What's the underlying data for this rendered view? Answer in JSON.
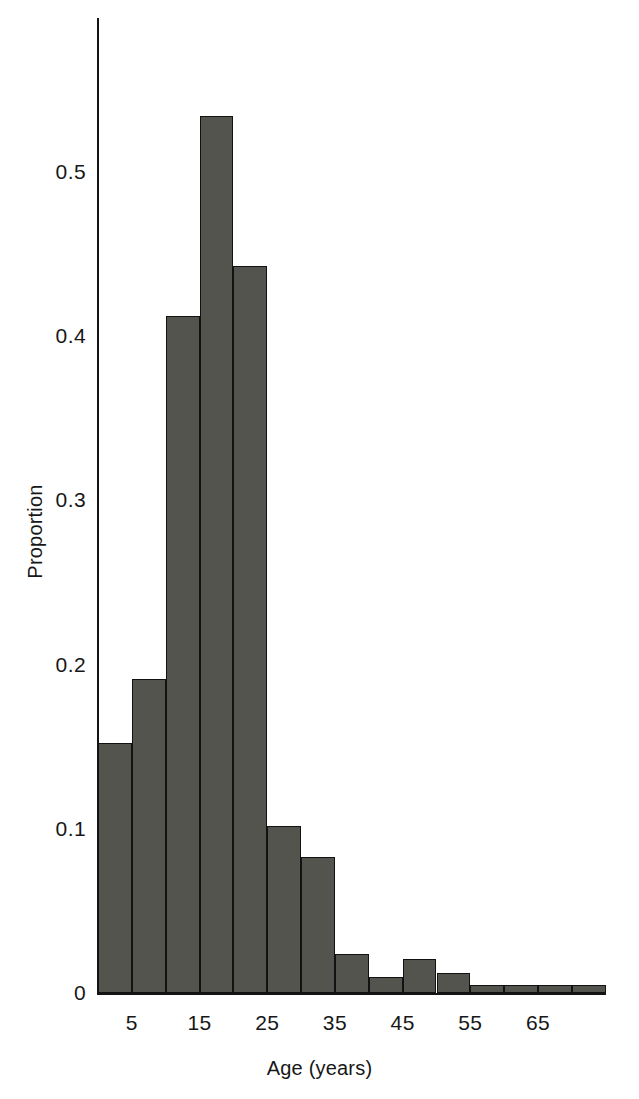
{
  "chart_data": {
    "type": "bar",
    "title": "",
    "subtitle": "",
    "xlabel": "Age (years)",
    "ylabel": "Proportion",
    "grid": false,
    "legend": null,
    "xlim": [
      0,
      75
    ],
    "ylim": [
      0,
      0.55
    ],
    "x_tick_labels": [
      "5",
      "15",
      "25",
      "35",
      "45",
      "55",
      "65"
    ],
    "x_tick_values": [
      5,
      15,
      25,
      35,
      45,
      55,
      65
    ],
    "y_tick_labels": [
      "0",
      "0.1",
      "0.2",
      "0.3",
      "0.4",
      "0.5"
    ],
    "y_tick_values": [
      0,
      0.1,
      0.2,
      0.3,
      0.4,
      0.5
    ],
    "bin_width": 5,
    "bin_edges": [
      0,
      5,
      10,
      15,
      20,
      25,
      30,
      35,
      40,
      45,
      50,
      55,
      60,
      65,
      70,
      75
    ],
    "categories": [
      "0-5",
      "5-10",
      "10-15",
      "15-20",
      "20-25",
      "25-30",
      "30-35",
      "35-40",
      "40-45",
      "45-50",
      "50-55",
      "55-60",
      "60-65",
      "65-70",
      "70-75"
    ],
    "values": [
      0.152,
      0.191,
      0.412,
      0.534,
      0.443,
      0.102,
      0.083,
      0.024,
      0.01,
      0.021,
      0.012,
      0.005,
      0.005,
      0.005,
      0.005
    ],
    "bar_color": "#54544f",
    "bar_edge_color": "#121212",
    "axis_color": "#141414"
  }
}
